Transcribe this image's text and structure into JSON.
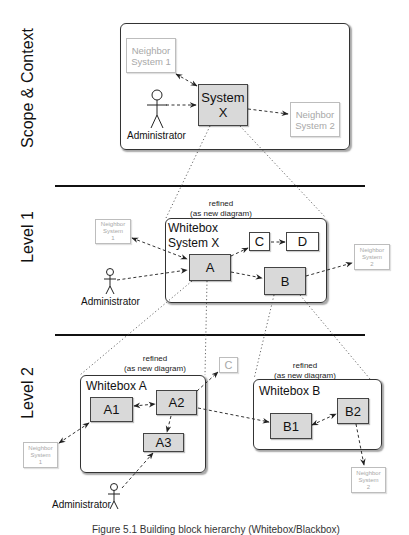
{
  "levels": {
    "scope": {
      "label": "Scope & Context"
    },
    "level1": {
      "label": "Level 1"
    },
    "level2": {
      "label": "Level 2"
    }
  },
  "scope_context": {
    "system": {
      "label": "System\nX"
    },
    "neighbor1": {
      "label": "Neighbor\nSystem 1"
    },
    "neighbor2": {
      "label": "Neighbor\nSystem 2"
    },
    "actor": {
      "label": "Administrator"
    }
  },
  "level1": {
    "note": "refined\n(as new diagram)",
    "frame_title": "Whitebox\nSystem X",
    "blocks": {
      "a": "A",
      "b": "B",
      "c": "C",
      "d": "D"
    },
    "neighbor1": {
      "label": "Neighbor\nSystem\n1"
    },
    "neighbor2": {
      "label": "Neighbor\nSystem\n2"
    },
    "actor": {
      "label": "Administrator"
    }
  },
  "level2": {
    "whitebox_a": {
      "note": "refined\n(as new diagram)",
      "frame_title": "Whitebox A",
      "blocks": {
        "a1": "A1",
        "a2": "A2",
        "a3": "A3"
      },
      "ghost_c": "C",
      "neighbor1": {
        "label": "Neighbor\nSystem\n1"
      },
      "actor": {
        "label": "Administrator"
      }
    },
    "whitebox_b": {
      "note": "refined\n(as new diagram)",
      "frame_title": "Whitebox B",
      "blocks": {
        "b1": "B1",
        "b2": "B2"
      },
      "neighbor2": {
        "label": "Neighbor\nSystem\n2"
      }
    }
  },
  "caption": "Figure 5.1 Building block hierarchy (Whitebox/Blackbox)",
  "colors": {
    "block_fill": "#d9d9d9",
    "ghost_text": "#a8a8a8",
    "line": "#333333"
  }
}
